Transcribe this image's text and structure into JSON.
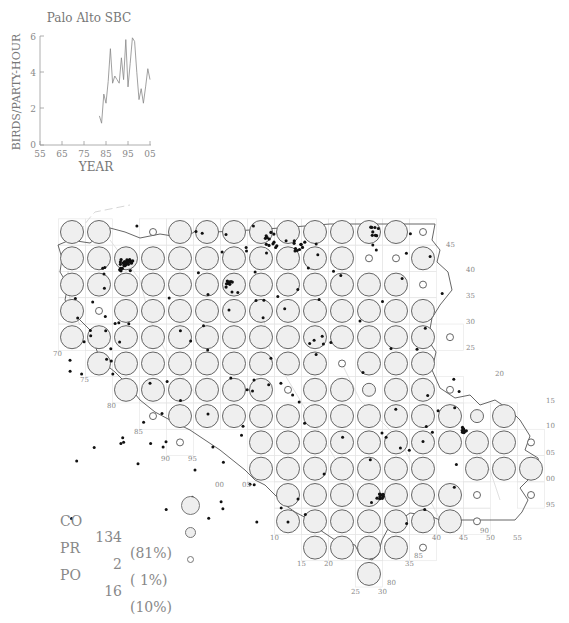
{
  "chart_data": {
    "type": "line",
    "title": "Palo Alto SBC",
    "xlabel": "YEAR",
    "ylabel": "BIRDS/PARTY-HOUR",
    "xlim": [
      55,
      105
    ],
    "ylim": [
      0,
      6
    ],
    "x_ticks": [
      "55",
      "65",
      "75",
      "85",
      "95",
      "05"
    ],
    "y_ticks": [
      "0",
      "2",
      "4",
      "6"
    ],
    "grid": false,
    "series": [
      {
        "name": "Palo Alto SBC",
        "x": [
          82,
          83,
          84,
          85,
          86,
          87,
          88,
          89,
          90,
          91,
          92,
          93,
          94,
          95,
          96,
          97,
          98,
          99,
          100,
          101,
          102,
          103,
          104,
          105
        ],
        "values": [
          1.6,
          1.2,
          2.8,
          2.3,
          3.5,
          5.3,
          3.4,
          3.8,
          3.6,
          3.4,
          4.8,
          3.6,
          5.8,
          3.2,
          4.5,
          5.9,
          5.7,
          4.0,
          2.5,
          3.1,
          2.3,
          3.2,
          4.2,
          3.6
        ]
      }
    ]
  },
  "map": {
    "grid": {
      "origin_x": 72,
      "origin_y": 232,
      "dx": 27,
      "dy": 26.3,
      "rows": [
        {
          "start": 0,
          "cells": "LL.SLLLLLLLLLS"
        },
        {
          "start": 0,
          "cells": "LLLLLLLLLLLSSL"
        },
        {
          "start": 0,
          "cells": "LLLLLLLLLLLLLS"
        },
        {
          "start": 0,
          "cells": "LSLLLLLLLLLLLL"
        },
        {
          "start": 0,
          "cells": "LLLLLLLLLLLLLLS"
        },
        {
          "start": 1,
          "cells": "LLLLLLLLLSLLL"
        },
        {
          "start": 2,
          "cells": "LLLLLLSLLMLLS"
        },
        {
          "start": 3,
          "cells": "SLLLLLLLLLLLML"
        },
        {
          "start": 4,
          "cells": "S..LLLLLLLLLLS"
        },
        {
          "start": 7,
          "cells": "LLLLLLL.LLL"
        },
        {
          "start": 8,
          "cells": "LLLLLLLS.S"
        },
        {
          "start": 8,
          "cells": "LLLLLLLS"
        },
        {
          "start": 9,
          "cells": "LLLLS"
        },
        {
          "start": 11,
          "cells": "L"
        }
      ]
    },
    "grid_labels": [
      {
        "text": "45",
        "x": 446,
        "y": 247
      },
      {
        "text": "40",
        "x": 466,
        "y": 272
      },
      {
        "text": "35",
        "x": 466,
        "y": 298
      },
      {
        "text": "30",
        "x": 466,
        "y": 324
      },
      {
        "text": "25",
        "x": 466,
        "y": 350
      },
      {
        "text": "20",
        "x": 495,
        "y": 376
      },
      {
        "text": "15",
        "x": 546,
        "y": 403
      },
      {
        "text": "10",
        "x": 546,
        "y": 428
      },
      {
        "text": "05",
        "x": 546,
        "y": 455
      },
      {
        "text": "00",
        "x": 546,
        "y": 481
      },
      {
        "text": "95",
        "x": 546,
        "y": 507
      },
      {
        "text": "70",
        "x": 53,
        "y": 356
      },
      {
        "text": "75",
        "x": 80,
        "y": 382
      },
      {
        "text": "80",
        "x": 107,
        "y": 408
      },
      {
        "text": "85",
        "x": 134,
        "y": 434
      },
      {
        "text": "90",
        "x": 161,
        "y": 461
      },
      {
        "text": "95",
        "x": 188,
        "y": 461
      },
      {
        "text": "00",
        "x": 215,
        "y": 487
      },
      {
        "text": "05",
        "x": 242,
        "y": 487
      },
      {
        "text": "10",
        "x": 270,
        "y": 540
      },
      {
        "text": "15",
        "x": 297,
        "y": 566
      },
      {
        "text": "20",
        "x": 324,
        "y": 566
      },
      {
        "text": "25",
        "x": 351,
        "y": 594
      },
      {
        "text": "30",
        "x": 378,
        "y": 594
      },
      {
        "text": "80",
        "x": 387,
        "y": 585
      },
      {
        "text": "35",
        "x": 405,
        "y": 566
      },
      {
        "text": "85",
        "x": 414,
        "y": 558
      },
      {
        "text": "40",
        "x": 432,
        "y": 540
      },
      {
        "text": "45",
        "x": 459,
        "y": 540
      },
      {
        "text": "90",
        "x": 480,
        "y": 533
      },
      {
        "text": "50",
        "x": 486,
        "y": 540
      },
      {
        "text": "55",
        "x": 513,
        "y": 540
      }
    ]
  },
  "legend": {
    "items": [
      {
        "code": "CO",
        "count": "134",
        "pct": "(81%)",
        "size": "large"
      },
      {
        "code": "PR",
        "count": "2",
        "pct": "( 1%)",
        "size": "medium"
      },
      {
        "code": "PO",
        "count": "16",
        "pct": "(10%)",
        "size": "small"
      }
    ]
  }
}
